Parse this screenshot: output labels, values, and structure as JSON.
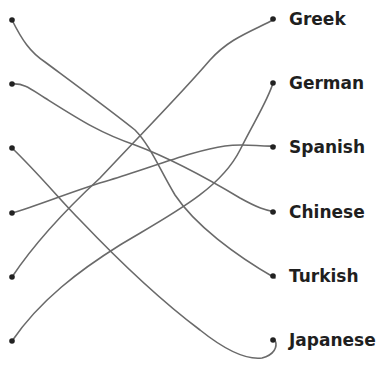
{
  "diagram": {
    "type": "matching-lines",
    "left_dots": [
      {
        "id": "L1",
        "x": 12,
        "y": 20
      },
      {
        "id": "L2",
        "x": 12,
        "y": 84
      },
      {
        "id": "L3",
        "x": 12,
        "y": 148
      },
      {
        "id": "L4",
        "x": 12,
        "y": 213
      },
      {
        "id": "L5",
        "x": 12,
        "y": 277
      },
      {
        "id": "L6",
        "x": 12,
        "y": 341
      }
    ],
    "right_items": [
      {
        "label": "Greek",
        "y": 19
      },
      {
        "label": "German",
        "y": 83
      },
      {
        "label": "Spanish",
        "y": 147
      },
      {
        "label": "Chinese",
        "y": 212
      },
      {
        "label": "Turkish",
        "y": 276
      },
      {
        "label": "Japanese",
        "y": 340
      }
    ],
    "connections": [
      {
        "from": "L1",
        "to": "Turkish"
      },
      {
        "from": "L2",
        "to": "Chinese"
      },
      {
        "from": "L3",
        "to": "Japanese"
      },
      {
        "from": "L4",
        "to": "Spanish"
      },
      {
        "from": "L5",
        "to": "Greek"
      },
      {
        "from": "L6",
        "to": "German"
      }
    ],
    "line_color": "#6a6a6a",
    "dot_color": "#222222"
  }
}
